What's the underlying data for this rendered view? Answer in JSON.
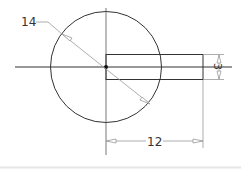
{
  "drawing": {
    "diameter_label": "14",
    "length_label": "12",
    "height_label": "3",
    "colors": {
      "geometry": "#333333",
      "centerline": "#444444",
      "dimension": "#888888",
      "bottom_rule": "#e6e6e6"
    }
  }
}
